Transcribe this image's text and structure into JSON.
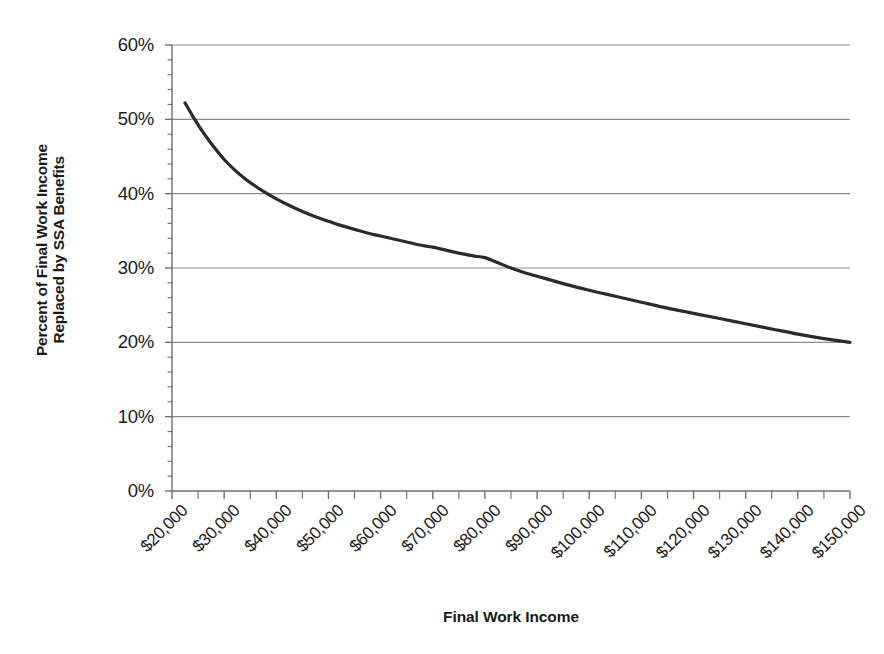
{
  "chart_data": {
    "type": "line",
    "title": "",
    "xlabel": "Final Work Income",
    "ylabel": "Percent of Final Work Income Replaced by SSA Benefits",
    "ylabel_lines": [
      "Percent of Final Work Income",
      "Replaced by SSA Benefits"
    ],
    "xlim": [
      20000,
      150000
    ],
    "ylim": [
      0,
      60
    ],
    "grid": "horizontal-major-only",
    "legend": "none",
    "x_major_step": 10000,
    "x_minor_step": 5000,
    "y_major_step": 10,
    "y_minor_step": 2,
    "y_tick_labels": [
      "60%",
      "50%",
      "40%",
      "30%",
      "20%",
      "10%",
      "0%"
    ],
    "y_tick_values": [
      60,
      50,
      40,
      30,
      20,
      10,
      0
    ],
    "x_tick_labels": [
      "$20,000",
      "$30,000",
      "$40,000",
      "$50,000",
      "$60,000",
      "$70,000",
      "$80,000",
      "$90,000",
      "$100,000",
      "$110,000",
      "$120,000",
      "$130,000",
      "$140,000",
      "$150,000"
    ],
    "x_tick_values": [
      20000,
      30000,
      40000,
      50000,
      60000,
      70000,
      80000,
      90000,
      100000,
      110000,
      120000,
      130000,
      140000,
      150000
    ],
    "series": [
      {
        "name": "Percent of Final Work Income Replaced by SSA Benefits",
        "color": "#2b2b2b",
        "line_width": 3.2,
        "markers": "none",
        "x": [
          22500,
          24000,
          26000,
          28000,
          30000,
          32000,
          34000,
          36000,
          38000,
          40000,
          42500,
          45000,
          47500,
          50000,
          52500,
          55000,
          57500,
          60000,
          62500,
          65000,
          67500,
          70000,
          72500,
          75000,
          76500,
          78000,
          80000,
          82500,
          85000,
          87500,
          90000,
          95000,
          100000,
          105000,
          110000,
          115000,
          120000,
          125000,
          130000,
          135000,
          140000,
          145000,
          150000
        ],
        "y": [
          52.2,
          50.4,
          48.2,
          46.3,
          44.6,
          43.2,
          42.0,
          41.0,
          40.1,
          39.3,
          38.4,
          37.6,
          36.9,
          36.3,
          35.7,
          35.2,
          34.7,
          34.3,
          33.9,
          33.5,
          33.1,
          32.8,
          32.4,
          32.0,
          31.8,
          31.6,
          31.4,
          30.7,
          30.0,
          29.4,
          28.9,
          27.9,
          27.0,
          26.2,
          25.4,
          24.6,
          23.9,
          23.2,
          22.5,
          21.8,
          21.1,
          20.5,
          20.0
        ]
      }
    ],
    "annotations": [
      "Curve decays steeply from about 52% near $22,500 and flattens toward 20% at $150,000.",
      "Slight flattening / inflection near $76,000-$78,000 around 31.5%."
    ],
    "colors": {
      "line": "#2b2b2b",
      "gridline": "#8c8c8c",
      "axis": "#6e6e6e",
      "text": "#1a1a1a",
      "background": "#ffffff"
    }
  }
}
